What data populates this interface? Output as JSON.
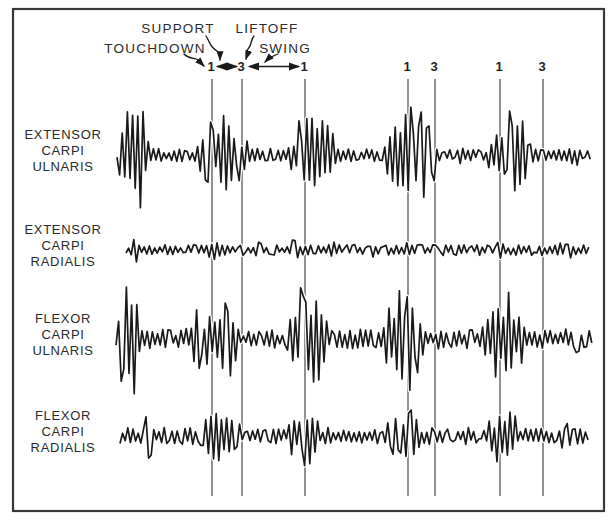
{
  "colors": {
    "ink": "#1a1a1a",
    "marker_line": "#4d4d4d",
    "frame": "#383838",
    "background": "#ffffff",
    "text": "#2b2b2b"
  },
  "annotations": {
    "touchdown_label": "TOUCHDOWN",
    "support_label": "SUPPORT",
    "liftoff_label": "LIFTOFF",
    "swing_label": "SWING"
  },
  "muscles": [
    {
      "lines": [
        "EXTENSOR",
        "CARPI",
        "ULNARIS"
      ]
    },
    {
      "lines": [
        "EXTENSOR",
        "CARPI",
        "RADIALIS"
      ]
    },
    {
      "lines": [
        "FLEXOR",
        "CARPI",
        "ULNARIS"
      ]
    },
    {
      "lines": [
        "FLEXOR",
        "CARPI",
        "RADIALIS"
      ]
    }
  ],
  "chart_data": {
    "type": "line",
    "title": "",
    "gait_events": {
      "labels": [
        "1",
        "3",
        "1",
        "1",
        "3",
        "1",
        "3"
      ],
      "x": [
        212,
        242,
        305,
        408,
        435,
        500,
        543
      ],
      "event_key": {
        "touchdown": "1",
        "liftoff": "3"
      }
    },
    "phase_spans": {
      "support": {
        "x1": 217,
        "x2": 237
      },
      "swing": {
        "x1": 249,
        "x2": 299
      }
    },
    "series": [
      {
        "name": "EXTENSOR CARPI ULNARIS",
        "baseline_y": 155,
        "x_start": 117,
        "x_end": 591,
        "noise_amp": 6.5,
        "seed": 7,
        "bursts": [
          {
            "x": 117,
            "w": 34,
            "amp": 60
          },
          {
            "x": 178,
            "w": 10,
            "amp": 12
          },
          {
            "x": 196,
            "w": 54,
            "amp": 40
          },
          {
            "x": 286,
            "w": 52,
            "amp": 46
          },
          {
            "x": 384,
            "w": 56,
            "amp": 52
          },
          {
            "x": 455,
            "w": 12,
            "amp": 11
          },
          {
            "x": 487,
            "w": 48,
            "amp": 46
          },
          {
            "x": 566,
            "w": 16,
            "amp": 12
          }
        ]
      },
      {
        "name": "EXTENSOR CARPI RADIALIS",
        "baseline_y": 250,
        "x_start": 126,
        "x_end": 590,
        "noise_amp": 5.5,
        "seed": 13,
        "bursts": [
          {
            "x": 129,
            "w": 9,
            "amp": 19
          },
          {
            "x": 206,
            "w": 16,
            "amp": 10
          },
          {
            "x": 253,
            "w": 14,
            "amp": 9
          },
          {
            "x": 282,
            "w": 22,
            "amp": 10
          },
          {
            "x": 328,
            "w": 14,
            "amp": 9
          },
          {
            "x": 366,
            "w": 12,
            "amp": 9
          },
          {
            "x": 400,
            "w": 18,
            "amp": 10
          },
          {
            "x": 446,
            "w": 14,
            "amp": 9
          },
          {
            "x": 490,
            "w": 20,
            "amp": 10
          },
          {
            "x": 550,
            "w": 28,
            "amp": 11
          }
        ]
      },
      {
        "name": "FLEXOR CARPI ULNARIS",
        "baseline_y": 339,
        "x_start": 116,
        "x_end": 592,
        "noise_amp": 10,
        "seed": 21,
        "bursts": [
          {
            "x": 116,
            "w": 27,
            "amp": 64
          },
          {
            "x": 184,
            "w": 36,
            "amp": 32
          },
          {
            "x": 212,
            "w": 26,
            "amp": 52
          },
          {
            "x": 285,
            "w": 44,
            "amp": 60
          },
          {
            "x": 382,
            "w": 46,
            "amp": 58
          },
          {
            "x": 479,
            "w": 50,
            "amp": 48
          },
          {
            "x": 562,
            "w": 24,
            "amp": 16
          }
        ]
      },
      {
        "name": "FLEXOR CARPI RADIALIS",
        "baseline_y": 436,
        "x_start": 120,
        "x_end": 590,
        "noise_amp": 8.5,
        "seed": 31,
        "bursts": [
          {
            "x": 142,
            "w": 15,
            "amp": 26
          },
          {
            "x": 197,
            "w": 48,
            "amp": 26
          },
          {
            "x": 285,
            "w": 38,
            "amp": 30
          },
          {
            "x": 382,
            "w": 42,
            "amp": 31
          },
          {
            "x": 483,
            "w": 40,
            "amp": 29
          },
          {
            "x": 556,
            "w": 20,
            "amp": 15
          }
        ]
      }
    ]
  }
}
